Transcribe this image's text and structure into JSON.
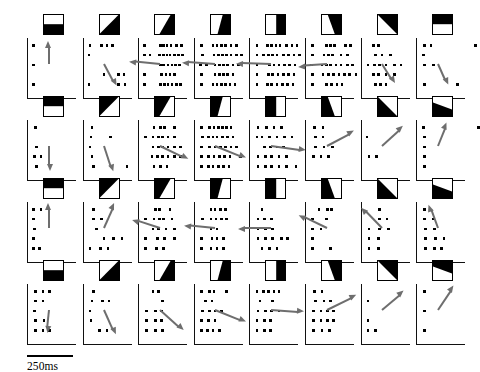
{
  "figure": {
    "type": "spike-raster-grid",
    "rows": 4,
    "cols": 8
  },
  "scale_bar": {
    "label": "250ms",
    "length_px": 46,
    "name": "time-scale-bar"
  },
  "colors": {
    "ink": "#000000",
    "paper": "#ffffff",
    "arrow": "#6e6e6e",
    "axis": "#111111"
  },
  "icon_legend": {
    "shape": "square",
    "fill_dark": "#000000",
    "fill_light": "#ffffff",
    "note": "black region rotates through 8 edge orientations per row"
  },
  "chart_data": {
    "type": "raster",
    "title": "",
    "xlabel": "",
    "ylabel": "",
    "time_unit": "ms",
    "scale_bar_ms": 250,
    "trials_per_panel": 5,
    "panels": [
      {
        "row": 1,
        "col": 1,
        "stimulus_angle_deg": 0,
        "icon_black_half": "bottom",
        "arrow": {
          "angle_deg": -90,
          "length": 22
        },
        "trials": [
          [
            2,
            57
          ],
          [],
          [
            2
          ],
          [],
          [
            2,
            55
          ]
        ]
      },
      {
        "row": 1,
        "col": 2,
        "stimulus_angle_deg": 22.5,
        "icon_black_half": "bottom-right",
        "arrow": {
          "angle_deg": 62,
          "length": 24
        },
        "trials": [
          [
            3,
            14,
            19,
            24
          ],
          [
            2
          ],
          [],
          [
            16,
            30,
            35
          ],
          [
            2,
            30,
            36
          ]
        ]
      },
      {
        "row": 1,
        "col": 3,
        "stimulus_angle_deg": 45,
        "icon_black_half": "right-lower-diag",
        "arrow": {
          "angle_deg": 186,
          "length": 30
        },
        "trials": [
          [
            2,
            17,
            20,
            23,
            27,
            32,
            37
          ],
          [
            2,
            7,
            16,
            20,
            23,
            26,
            30,
            34,
            38
          ],
          [
            17,
            20,
            24,
            28,
            31,
            35
          ],
          [
            2,
            18,
            22,
            26,
            30
          ],
          [
            2,
            17,
            21,
            24,
            28,
            32,
            36
          ]
        ]
      },
      {
        "row": 1,
        "col": 4,
        "stimulus_angle_deg": 67.5,
        "icon_black_half": "right-narrow",
        "arrow": {
          "angle_deg": 184,
          "length": 32
        },
        "trials": [
          [
            3,
            14,
            18,
            22,
            26,
            31,
            36
          ],
          [
            4,
            15,
            19,
            23,
            27,
            31,
            36,
            41
          ],
          [
            2,
            8,
            16,
            20,
            24,
            28,
            33,
            38
          ],
          [
            3,
            16,
            20,
            24,
            28,
            33
          ],
          [
            3,
            14,
            18,
            22,
            26,
            30,
            35
          ]
        ]
      },
      {
        "row": 1,
        "col": 5,
        "stimulus_angle_deg": 90,
        "icon_black_half": "right",
        "arrow": {
          "angle_deg": 182,
          "length": 34
        },
        "trials": [
          [
            3,
            13,
            17,
            21,
            25,
            31,
            36,
            41
          ],
          [
            3,
            9,
            14,
            18,
            22,
            28,
            33,
            38,
            43
          ],
          [
            3,
            15,
            19,
            24,
            29,
            34,
            39
          ],
          [
            3,
            14,
            18,
            23,
            28,
            33,
            38
          ],
          [
            3,
            13,
            17,
            22,
            27,
            32,
            37
          ]
        ]
      },
      {
        "row": 1,
        "col": 6,
        "stimulus_angle_deg": 112.5,
        "icon_black_half": "top-right-narrow",
        "arrow": {
          "angle_deg": 176,
          "length": 28
        },
        "trials": [
          [
            3,
            16,
            20,
            24,
            34,
            39
          ],
          [
            3,
            14,
            18,
            22,
            30,
            36
          ],
          [
            2,
            12,
            16,
            20,
            25,
            30,
            36,
            41
          ],
          [
            3,
            13,
            18,
            23,
            28,
            33,
            38,
            44
          ],
          [
            3,
            16,
            21,
            26,
            31
          ]
        ]
      },
      {
        "row": 1,
        "col": 7,
        "stimulus_angle_deg": 135,
        "icon_black_half": "top-right-diag",
        "arrow": {
          "angle_deg": 58,
          "length": 22
        },
        "trials": [
          [
            8,
            13
          ],
          [
            10,
            16,
            24
          ],
          [
            3,
            9,
            14,
            20,
            28,
            34
          ],
          [
            8,
            13,
            20,
            28
          ],
          [
            10,
            15,
            20
          ]
        ]
      },
      {
        "row": 1,
        "col": 8,
        "stimulus_angle_deg": 157.5,
        "icon_black_half": "top",
        "arrow": {
          "angle_deg": 66,
          "length": 22
        },
        "trials": [
          [
            4,
            10,
            52
          ],
          [
            3
          ],
          [
            4,
            12
          ],
          [],
          [
            4,
            35
          ]
        ]
      },
      {
        "row": 2,
        "col": 1,
        "stimulus_angle_deg": 180,
        "icon_black_half": "top",
        "arrow": {
          "angle_deg": 90,
          "length": 24
        },
        "trials": [
          [
            4
          ],
          [],
          [
            5
          ],
          [
            3,
            9
          ],
          [
            5
          ]
        ]
      },
      {
        "row": 2,
        "col": 2,
        "stimulus_angle_deg": 202.5,
        "icon_black_half": "top-left-diag",
        "arrow": {
          "angle_deg": 72,
          "length": 26
        },
        "trials": [
          [
            5
          ],
          [
            4,
            22
          ],
          [
            3
          ],
          [
            5
          ],
          [
            6,
            38
          ]
        ]
      },
      {
        "row": 2,
        "col": 3,
        "stimulus_angle_deg": 225,
        "icon_black_half": "left-lower-diag",
        "arrow": {
          "angle_deg": 26,
          "length": 30
        },
        "trials": [
          [
            11,
            17,
            21,
            30
          ],
          [
            3,
            10,
            15,
            19,
            24,
            30
          ],
          [
            10,
            15,
            19,
            24,
            30,
            36
          ],
          [
            9,
            14,
            19,
            24,
            30,
            36
          ],
          [
            11,
            17,
            23
          ]
        ]
      },
      {
        "row": 2,
        "col": 4,
        "stimulus_angle_deg": 247.5,
        "icon_black_half": "left-narrow",
        "arrow": {
          "angle_deg": 22,
          "length": 32
        },
        "trials": [
          [
            3,
            11,
            15,
            19,
            23,
            27,
            31
          ],
          [
            4,
            10,
            14,
            18,
            23,
            28,
            33
          ],
          [
            3,
            11,
            16,
            21,
            26,
            31,
            36
          ],
          [
            3,
            10,
            15,
            20,
            25,
            30,
            40
          ],
          [
            3,
            10,
            14,
            19,
            24,
            29
          ]
        ]
      },
      {
        "row": 2,
        "col": 5,
        "stimulus_angle_deg": 270,
        "icon_black_half": "left",
        "arrow": {
          "angle_deg": 8,
          "length": 34
        },
        "trials": [
          [
            4,
            12,
            19,
            26
          ],
          [
            3,
            8,
            15,
            22,
            29,
            36
          ],
          [
            10,
            16,
            22,
            28
          ],
          [
            4,
            11,
            17,
            24,
            31
          ],
          [
            4,
            11,
            17,
            24,
            31,
            40
          ]
        ]
      },
      {
        "row": 2,
        "col": 6,
        "stimulus_angle_deg": 292.5,
        "icon_black_half": "bottom-left-narrow",
        "arrow": {
          "angle_deg": -28,
          "length": 30
        },
        "trials": [
          [
            5,
            13
          ],
          [
            6,
            13
          ],
          [
            6,
            14,
            22
          ],
          [
            4,
            11,
            18
          ],
          []
        ]
      },
      {
        "row": 2,
        "col": 7,
        "stimulus_angle_deg": 315,
        "icon_black_half": "bottom-left-diag",
        "arrow": {
          "angle_deg": -42,
          "length": 28
        },
        "trials": [
          [],
          [
            2
          ],
          [],
          [
            4,
            11
          ],
          []
        ]
      },
      {
        "row": 2,
        "col": 8,
        "stimulus_angle_deg": 337.5,
        "icon_black_half": "bottom-wedge",
        "arrow": {
          "angle_deg": -68,
          "length": 24
        },
        "trials": [
          [
            3,
            55
          ],
          [
            4
          ],
          [
            4
          ],
          [
            4
          ],
          [
            4
          ]
        ]
      },
      {
        "row": 3,
        "col": 1,
        "stimulus_angle_deg": 0,
        "icon_black_half": "top",
        "arrow": {
          "angle_deg": -90,
          "length": 24
        },
        "trials": [
          [
            2,
            9
          ],
          [
            2
          ],
          [
            3
          ],
          [
            2
          ],
          [
            2,
            8
          ]
        ]
      },
      {
        "row": 3,
        "col": 2,
        "stimulus_angle_deg": 22.5,
        "icon_black_half": "top-left-diag",
        "arrow": {
          "angle_deg": -66,
          "length": 26
        },
        "trials": [
          [
            6
          ],
          [
            6,
            14
          ],
          [
            9
          ],
          [
            16,
            25,
            33
          ],
          [
            3,
            13,
            20
          ]
        ]
      },
      {
        "row": 3,
        "col": 3,
        "stimulus_angle_deg": 45,
        "icon_black_half": "left-lower-diag",
        "arrow": {
          "angle_deg": 198,
          "length": 28
        },
        "trials": [
          [
            12,
            16,
            26
          ],
          [
            3,
            11,
            16,
            20,
            28
          ],
          [
            10,
            15,
            22,
            30
          ],
          [
            3,
            14,
            21,
            30
          ],
          [
            3,
            13,
            20
          ]
        ]
      },
      {
        "row": 3,
        "col": 4,
        "stimulus_angle_deg": 67.5,
        "icon_black_half": "left-narrow",
        "arrow": {
          "angle_deg": 186,
          "length": 30
        },
        "trials": [
          [
            12,
            16,
            21,
            26
          ],
          [
            4,
            12,
            17,
            22,
            27
          ],
          [
            12,
            18
          ],
          [
            3,
            13,
            18,
            24
          ],
          [
            3,
            12,
            18,
            24
          ]
        ]
      },
      {
        "row": 3,
        "col": 5,
        "stimulus_angle_deg": 90,
        "icon_black_half": "left",
        "arrow": {
          "angle_deg": 180,
          "length": 32
        },
        "trials": [
          [
            8
          ],
          [
            4,
            10,
            17
          ],
          [
            4,
            11,
            18
          ],
          [
            4,
            11,
            18,
            26,
            32
          ],
          [
            8,
            15,
            22
          ]
        ]
      },
      {
        "row": 3,
        "col": 6,
        "stimulus_angle_deg": 112.5,
        "icon_black_half": "bottom-left-narrow",
        "arrow": {
          "angle_deg": 206,
          "length": 30
        },
        "trials": [
          [
            9,
            17,
            21
          ],
          [
            3,
            16
          ],
          [
            3,
            11
          ],
          [
            3
          ],
          [
            3,
            20
          ]
        ]
      },
      {
        "row": 3,
        "col": 7,
        "stimulus_angle_deg": 135,
        "icon_black_half": "bottom-left-diag",
        "arrow": {
          "angle_deg": 226,
          "length": 28
        },
        "trials": [
          [
            14
          ],
          [
            14,
            21
          ],
          [
            4,
            14,
            22
          ],
          [
            4,
            13
          ],
          [
            4,
            13
          ]
        ]
      },
      {
        "row": 3,
        "col": 8,
        "stimulus_angle_deg": 157.5,
        "icon_black_half": "bottom-wedge",
        "arrow": {
          "angle_deg": 250,
          "length": 24
        },
        "trials": [
          [
            4
          ],
          [
            4,
            12
          ],
          [
            5,
            13
          ],
          [
            5,
            14,
            22
          ],
          [
            5,
            13,
            20
          ]
        ]
      },
      {
        "row": 4,
        "col": 1,
        "stimulus_angle_deg": 180,
        "icon_black_half": "bottom",
        "arrow": {
          "angle_deg": 96,
          "length": 22
        },
        "trials": [
          [
            4,
            11,
            17
          ],
          [
            4,
            11
          ],
          [
            3
          ],
          [
            4,
            12
          ],
          [
            4,
            11,
            17
          ]
        ]
      },
      {
        "row": 4,
        "col": 2,
        "stimulus_angle_deg": 202.5,
        "icon_black_half": "bottom-right-diag",
        "arrow": {
          "angle_deg": 66,
          "length": 26
        },
        "trials": [
          [
            6
          ],
          [
            5,
            15,
            21
          ],
          [
            3
          ],
          [
            4
          ],
          [
            12,
            19
          ]
        ]
      },
      {
        "row": 4,
        "col": 3,
        "stimulus_angle_deg": 225,
        "icon_black_half": "right-lower-diag",
        "arrow": {
          "angle_deg": 42,
          "length": 30
        },
        "trials": [
          [
            10,
            15
          ],
          [
            19
          ],
          [
            4,
            12,
            18
          ],
          [
            4,
            12,
            18
          ],
          [
            4,
            12,
            19
          ]
        ]
      },
      {
        "row": 4,
        "col": 4,
        "stimulus_angle_deg": 247.5,
        "icon_black_half": "right-narrow",
        "arrow": {
          "angle_deg": 22,
          "length": 32
        },
        "trials": [
          [
            3,
            11,
            15,
            27
          ],
          [
            7,
            13
          ],
          [
            4,
            11,
            16,
            22
          ],
          [
            3,
            10,
            16
          ],
          [
            3,
            9,
            14,
            20
          ]
        ]
      },
      {
        "row": 4,
        "col": 5,
        "stimulus_angle_deg": 270,
        "icon_black_half": "right",
        "arrow": {
          "angle_deg": 4,
          "length": 32
        },
        "trials": [
          [
            3,
            9,
            14,
            19,
            24
          ],
          [
            6,
            18
          ],
          [
            4,
            11,
            17,
            24
          ],
          [
            3,
            10,
            16
          ],
          [
            3,
            10,
            16
          ]
        ]
      },
      {
        "row": 4,
        "col": 6,
        "stimulus_angle_deg": 292.5,
        "icon_black_half": "top-right-narrow",
        "arrow": {
          "angle_deg": -26,
          "length": 32
        },
        "trials": [
          [
            5,
            12
          ],
          [
            6,
            14,
            20
          ],
          [
            4,
            11,
            17,
            23
          ],
          [
            4,
            11,
            17,
            23
          ],
          [
            4,
            12,
            19
          ]
        ]
      },
      {
        "row": 4,
        "col": 7,
        "stimulus_angle_deg": 315,
        "icon_black_half": "top-right-diag",
        "arrow": {
          "angle_deg": -40,
          "length": 28
        },
        "trials": [
          [],
          [
            3
          ],
          [],
          [
            3
          ],
          [
            3,
            10
          ]
        ]
      },
      {
        "row": 4,
        "col": 8,
        "stimulus_angle_deg": 337.5,
        "icon_black_half": "top-wedge",
        "arrow": {
          "angle_deg": -56,
          "length": 28
        },
        "trials": [
          [
            4
          ],
          [],
          [
            4
          ],
          [],
          [
            4
          ]
        ]
      }
    ]
  }
}
